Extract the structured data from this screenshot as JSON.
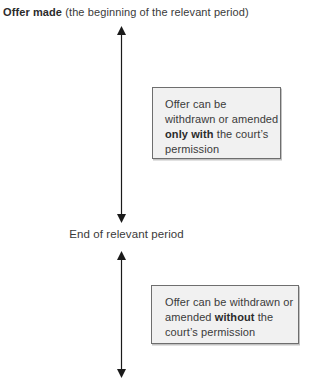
{
  "header": {
    "lines": [
      [
        {
          "t": "Offer made",
          "b": true
        },
        {
          "t": " (the beginning of the relevant period)"
        }
      ]
    ]
  },
  "midpoint_label": "End of relevant period",
  "box_during_period": {
    "lines": [
      [
        {
          "t": "Offer can be"
        }
      ],
      [
        {
          "t": "withdrawn or amended"
        }
      ],
      [
        {
          "t": "only with",
          "b": true
        },
        {
          "t": " the court’s"
        }
      ],
      [
        {
          "t": "permission"
        }
      ]
    ]
  },
  "box_after_period": {
    "lines": [
      [
        {
          "t": "Offer can be withdrawn or"
        }
      ],
      [
        {
          "t": "amended "
        },
        {
          "t": "without",
          "b": true
        },
        {
          "t": " the"
        }
      ],
      [
        {
          "t": "court’s permission"
        }
      ]
    ]
  },
  "colors": {
    "box_fill": "#f1f1f1",
    "box_border": "#6e6e6e",
    "arrow": "#1a1a1a",
    "text": "#3a3a3a"
  }
}
